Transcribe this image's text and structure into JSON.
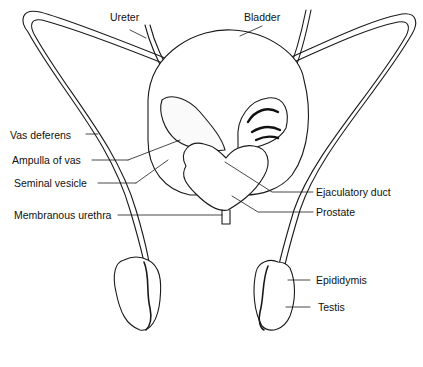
{
  "diagram": {
    "labels": {
      "ureter": "Ureter",
      "bladder": "Bladder",
      "vas_deferens": "Vas deferens",
      "ampulla_of_vas": "Ampulla of vas",
      "seminal_vesicle": "Seminal vesicle",
      "membranous_urethra": "Membranous urethra",
      "ejaculatory_duct": "Ejaculatory duct",
      "prostate": "Prostate",
      "epididymis": "Epididymis",
      "testis": "Testis"
    },
    "colors": {
      "ink": "#1a1a1a",
      "background": "#ffffff",
      "shade": "#555555"
    }
  }
}
